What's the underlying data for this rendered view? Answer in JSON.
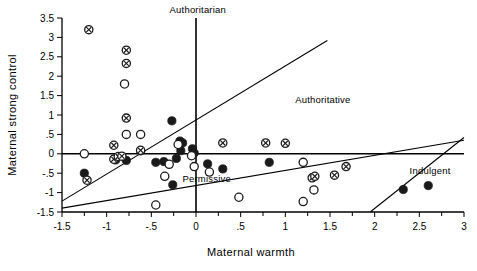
{
  "chart_data": {
    "type": "scatter",
    "title": "",
    "xlabel": "Maternal warmth",
    "ylabel": "Maternal strong control",
    "xlim": [
      -1.5,
      3
    ],
    "ylim": [
      -1.5,
      3.5
    ],
    "grid": false,
    "legend_position": "none",
    "xticks": [
      -1.5,
      -1,
      -0.5,
      0,
      0.5,
      1,
      1.5,
      2,
      2.5,
      3
    ],
    "xticklabels": [
      "-1.5",
      "-1",
      "-.5",
      "0",
      ".5",
      "1",
      "1.5",
      "2",
      "2.5",
      "3"
    ],
    "yticks": [
      -1.5,
      -1,
      -0.5,
      0,
      0.5,
      1,
      1.5,
      2,
      2.5,
      3,
      3.5
    ],
    "yticklabels": [
      "-1.5",
      "-1",
      "-.5",
      "0",
      ".5",
      "1",
      "1.5",
      "2",
      "2.5",
      "3",
      "3.5"
    ],
    "xtick_minor_step": 0.25,
    "annotations": [
      {
        "text": "Authoritarian",
        "x": 0.02,
        "y": 3.62,
        "anchor": "middle"
      },
      {
        "text": "Authoritative",
        "x": 1.42,
        "y": 1.32,
        "anchor": "middle"
      },
      {
        "text": "Permissive",
        "x": 0.12,
        "y": -0.72,
        "anchor": "middle"
      },
      {
        "text": "Indulgent",
        "x": 2.62,
        "y": -0.52,
        "anchor": "middle"
      }
    ],
    "reference_lines": [
      {
        "name": "vertical-axis-zero",
        "type": "vertical",
        "x": 0,
        "y0": -1.5,
        "y1": 3.5
      },
      {
        "name": "horizontal-axis-zero",
        "type": "horizontal",
        "y": 0,
        "x0": -1.5,
        "x1": 3
      },
      {
        "name": "authoritative-upper-divider",
        "type": "segment",
        "x0": -1.5,
        "y0": -1.22,
        "x1": 1.47,
        "y1": 2.92
      },
      {
        "name": "permissive-lower-divider",
        "type": "segment",
        "x0": -1.5,
        "y0": -1.4,
        "x1": 3.0,
        "y1": 0.35
      },
      {
        "name": "indulgent-divider",
        "type": "segment",
        "x0": 1.95,
        "y0": -1.5,
        "x1": 3.0,
        "y1": 0.42
      }
    ],
    "series": [
      {
        "name": "filled-circle",
        "marker": "filled-circle",
        "points": [
          [
            -1.25,
            -0.5
          ],
          [
            -0.27,
            0.85
          ],
          [
            -0.18,
            0.33
          ],
          [
            -0.15,
            0.28
          ],
          [
            -0.04,
            0.13
          ],
          [
            -0.02,
            0.02
          ],
          [
            -0.9,
            -0.16
          ],
          [
            -0.78,
            -0.17
          ],
          [
            -0.45,
            -0.22
          ],
          [
            -0.36,
            -0.2
          ],
          [
            -0.22,
            -0.12
          ],
          [
            -0.17,
            0.08
          ],
          [
            0.13,
            -0.26
          ],
          [
            0.3,
            -0.39
          ],
          [
            -0.26,
            -0.8
          ],
          [
            0.82,
            -0.22
          ],
          [
            2.32,
            -0.92
          ],
          [
            2.6,
            -0.82
          ]
        ]
      },
      {
        "name": "open-circle",
        "marker": "open-circle",
        "points": [
          [
            -0.8,
            1.8
          ],
          [
            -0.78,
            0.5
          ],
          [
            -0.62,
            0.08
          ],
          [
            -1.25,
            0.0
          ],
          [
            -0.62,
            0.5
          ],
          [
            -0.2,
            0.24
          ],
          [
            -0.05,
            -0.05
          ],
          [
            -0.02,
            -0.33
          ],
          [
            -0.35,
            -0.58
          ],
          [
            -0.3,
            -0.27
          ],
          [
            -0.45,
            -1.32
          ],
          [
            0.15,
            -0.47
          ],
          [
            0.48,
            -1.12
          ],
          [
            1.2,
            -0.22
          ],
          [
            1.2,
            -1.23
          ],
          [
            1.32,
            -0.93
          ]
        ]
      },
      {
        "name": "crossed-circle",
        "marker": "crossed-circle",
        "points": [
          [
            -1.2,
            3.2
          ],
          [
            -0.78,
            2.67
          ],
          [
            -0.78,
            2.33
          ],
          [
            -0.78,
            0.92
          ],
          [
            -0.92,
            0.22
          ],
          [
            -0.92,
            -0.14
          ],
          [
            -0.87,
            -0.07
          ],
          [
            -0.83,
            -0.06
          ],
          [
            -0.62,
            0.09
          ],
          [
            -1.22,
            -0.68
          ],
          [
            0.3,
            0.28
          ],
          [
            0.78,
            0.28
          ],
          [
            1.0,
            0.27
          ],
          [
            1.68,
            -0.33
          ],
          [
            1.55,
            -0.55
          ],
          [
            1.3,
            -0.62
          ],
          [
            1.33,
            -0.58
          ]
        ]
      }
    ]
  }
}
